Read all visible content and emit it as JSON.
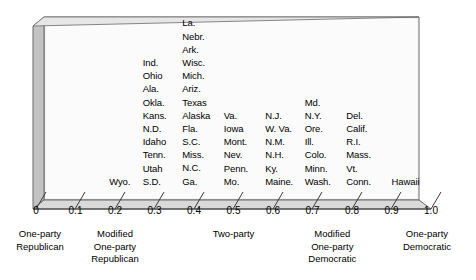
{
  "chart_data": {
    "type": "scatter",
    "title": "",
    "xlabel": "",
    "ylabel": "",
    "xlim": [
      0,
      1.0
    ],
    "grid": false,
    "legend": "none",
    "tick_labels": [
      "0",
      "0.1",
      "0.2",
      "0.3",
      "0.4",
      "0.5",
      "0.6",
      "0.7",
      "0.8",
      "0.9",
      "1.0"
    ],
    "tick_values": [
      0,
      0.1,
      0.2,
      0.3,
      0.4,
      0.5,
      0.6,
      0.7,
      0.8,
      0.9,
      1.0
    ],
    "category_labels": [
      {
        "value": 0.0,
        "lines": [
          "One-party",
          "Republican"
        ]
      },
      {
        "value": 0.2,
        "lines": [
          "Modified",
          "One-party",
          "Republican"
        ]
      },
      {
        "value": 0.5,
        "lines": [
          "Two-party"
        ]
      },
      {
        "value": 0.75,
        "lines": [
          "Modified",
          "One-party",
          "Democratic"
        ]
      },
      {
        "value": 1.0,
        "lines": [
          "One-party",
          "Democratic"
        ]
      }
    ],
    "columns": [
      {
        "value": 0.16,
        "items": [
          "Wyo."
        ]
      },
      {
        "value": 0.245,
        "items": [
          "Ind.",
          "Ohio",
          "Ala.",
          "Okla.",
          "Kans.",
          "N.D.",
          "Idaho",
          "Tenn.",
          "Utah",
          "S.D."
        ]
      },
      {
        "value": 0.345,
        "items": [
          "La.",
          "Nebr.",
          "Ark.",
          "Wisc.",
          "Mich.",
          "Ariz.",
          "Texas",
          "Alaska",
          "Fla.",
          "S.C.",
          "Miss.",
          "N.C.",
          "Ga."
        ]
      },
      {
        "value": 0.45,
        "items": [
          "Va.",
          "Iowa",
          "Mont.",
          "Nev.",
          "Penn.",
          "Mo."
        ]
      },
      {
        "value": 0.555,
        "items": [
          "N.J.",
          "W. Va.",
          "N.M.",
          "N.H.",
          "Ky.",
          "Maine."
        ]
      },
      {
        "value": 0.655,
        "items": [
          "Md.",
          "N.Y.",
          "Ore.",
          "Ill.",
          "Colo.",
          "Minn.",
          "Wash."
        ]
      },
      {
        "value": 0.76,
        "items": [
          "Del.",
          "Calif.",
          "R.I.",
          "Mass.",
          "Vt.",
          "Conn."
        ]
      },
      {
        "value": 0.875,
        "items": [
          "Hawaii"
        ]
      }
    ]
  },
  "colors": {
    "face": "#f2f2f2",
    "face_light": "#fbfbfb",
    "side": "#bdbdbd",
    "floor": "#d8d8d8",
    "outline": "#595959",
    "text": "#000000"
  }
}
